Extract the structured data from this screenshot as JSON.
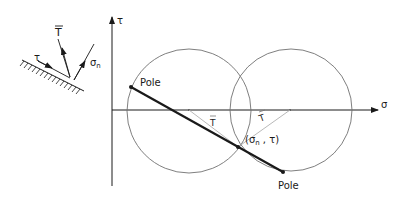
{
  "diagram": {
    "type": "mohr-circle-pole-construction",
    "axes": {
      "horizontal_label": "σ",
      "vertical_label": "τ"
    },
    "inset": {
      "traction_label": "T",
      "normal_stress_label": "σ",
      "normal_stress_subscript": "n",
      "shear_label": "τ"
    },
    "points": {
      "pole_left_label": "Pole",
      "pole_right_label": "Pole",
      "intersection_label": "(σ",
      "intersection_subscript": "n",
      "intersection_label_end": " , τ)"
    },
    "radius_labels": {
      "left": "T",
      "right": "T"
    },
    "colors": {
      "line": "#1a1a1a",
      "circle": "#707070",
      "construction": "#b0b0b0"
    }
  }
}
